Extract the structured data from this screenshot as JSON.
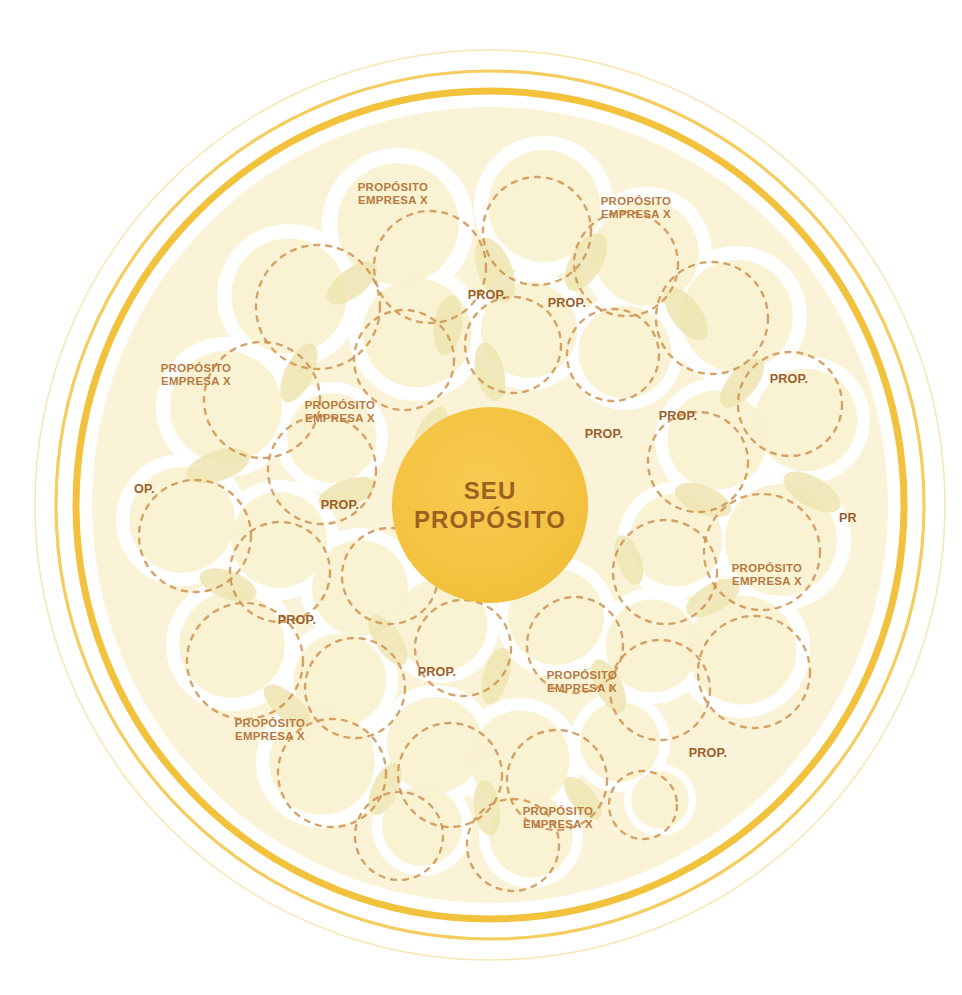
{
  "canvas": {
    "width": 962,
    "height": 995,
    "background": "#ffffff"
  },
  "colors": {
    "core_fill": "#f4c23f",
    "core_text": "#9c6120",
    "ring_thick": "#f2c23c",
    "ring_thin": "#f5cd5e",
    "ring_faint": "#f9e6b4",
    "field_fill": "#faf3d7",
    "bubble_fill": "#f8f1cf",
    "bubble_gap": "#ffffff",
    "overlap_fill": "#efe5b2",
    "dash_stroke": "#cf9350",
    "company_label": "#b8793f",
    "prop_label": "#9a5f2c"
  },
  "core": {
    "name": "seu-proposito-core",
    "line1": "SEU",
    "line2": "PROPÓSITO",
    "cx": 490,
    "cy": 505,
    "r": 98
  },
  "rings": [
    {
      "name": "ring-outer-faint",
      "r": 455,
      "width": 1.6,
      "color": "#f9e6b4"
    },
    {
      "name": "ring-middle-thin",
      "r": 434,
      "width": 3.2,
      "color": "#f5cd5e"
    },
    {
      "name": "ring-inner-thick",
      "r": 414,
      "width": 7.0,
      "color": "#f2c23c"
    },
    {
      "name": "field-boundary",
      "r": 398,
      "width": 0,
      "color": "#faf3d7"
    }
  ],
  "company_labels": [
    {
      "name": "label-company-1",
      "line1": "PROPÓSITO",
      "line2": "EMPRESA X",
      "x": 393,
      "y": 194
    },
    {
      "name": "label-company-2",
      "line1": "PROPÓSITO",
      "line2": "EMPRESA X",
      "x": 636,
      "y": 208
    },
    {
      "name": "label-company-3",
      "line1": "PROPÓSITO",
      "line2": "EMPRESA X",
      "x": 196,
      "y": 375
    },
    {
      "name": "label-company-4",
      "line1": "PROPÓSITO",
      "line2": "EMPRESA X",
      "x": 340,
      "y": 412
    },
    {
      "name": "label-company-5",
      "line1": "PROPÓSITO",
      "line2": "EMPRESA X",
      "x": 767,
      "y": 575
    },
    {
      "name": "label-company-6",
      "line1": "PROPÓSITO",
      "line2": "EMPRESA X",
      "x": 582,
      "y": 682
    },
    {
      "name": "label-company-7",
      "line1": "PROPÓSITO",
      "line2": "EMPRESA X",
      "x": 270,
      "y": 730
    },
    {
      "name": "label-company-8",
      "line1": "PROPÓSITO",
      "line2": "EMPRESA X",
      "x": 558,
      "y": 818
    }
  ],
  "prop_labels": [
    {
      "name": "label-prop-1",
      "text": "PROP.",
      "x": 487,
      "y": 295
    },
    {
      "name": "label-prop-2",
      "text": "PROP.",
      "x": 567,
      "y": 303
    },
    {
      "name": "label-prop-3",
      "text": "PROP.",
      "x": 789,
      "y": 379
    },
    {
      "name": "label-prop-4",
      "text": "PROP.",
      "x": 678,
      "y": 416
    },
    {
      "name": "label-prop-5",
      "text": "PROP.",
      "x": 604,
      "y": 434
    },
    {
      "name": "label-prop-6",
      "text": "PROP.",
      "x": 340,
      "y": 505
    },
    {
      "name": "label-prop-7",
      "text": "PROP.",
      "x": 297,
      "y": 620
    },
    {
      "name": "label-prop-8",
      "text": "PROP.",
      "x": 437,
      "y": 672
    },
    {
      "name": "label-prop-9",
      "text": "PROP.",
      "x": 708,
      "y": 753
    }
  ],
  "clipped_labels": [
    {
      "name": "label-clipped-left",
      "text": "OP.",
      "x": 134,
      "y": 489,
      "align": "left",
      "clip_width": 26
    },
    {
      "name": "label-clipped-right",
      "text": "PR",
      "x": 839,
      "y": 518,
      "align": "left",
      "clip_width": 20
    }
  ],
  "bubbles": [
    {
      "cx": 398,
      "cy": 224,
      "r": 76
    },
    {
      "cx": 544,
      "cy": 206,
      "r": 70
    },
    {
      "cx": 646,
      "cy": 253,
      "r": 66
    },
    {
      "cx": 289,
      "cy": 296,
      "r": 72
    },
    {
      "cx": 417,
      "cy": 333,
      "r": 68
    },
    {
      "cx": 529,
      "cy": 330,
      "r": 60
    },
    {
      "cx": 625,
      "cy": 352,
      "r": 58
    },
    {
      "cx": 737,
      "cy": 316,
      "r": 70
    },
    {
      "cx": 226,
      "cy": 407,
      "r": 70
    },
    {
      "cx": 332,
      "cy": 438,
      "r": 56
    },
    {
      "cx": 717,
      "cy": 440,
      "r": 62
    },
    {
      "cx": 806,
      "cy": 420,
      "r": 64
    },
    {
      "cx": 182,
      "cy": 520,
      "r": 66
    },
    {
      "cx": 279,
      "cy": 540,
      "r": 60
    },
    {
      "cx": 360,
      "cy": 588,
      "r": 60
    },
    {
      "cx": 676,
      "cy": 540,
      "r": 58
    },
    {
      "cx": 781,
      "cy": 540,
      "r": 70
    },
    {
      "cx": 232,
      "cy": 645,
      "r": 66
    },
    {
      "cx": 340,
      "cy": 680,
      "r": 58
    },
    {
      "cx": 441,
      "cy": 625,
      "r": 58
    },
    {
      "cx": 556,
      "cy": 617,
      "r": 60
    },
    {
      "cx": 652,
      "cy": 646,
      "r": 58
    },
    {
      "cx": 742,
      "cy": 650,
      "r": 68
    },
    {
      "cx": 322,
      "cy": 762,
      "r": 66
    },
    {
      "cx": 435,
      "cy": 745,
      "r": 60
    },
    {
      "cx": 520,
      "cy": 760,
      "r": 62
    },
    {
      "cx": 620,
      "cy": 742,
      "r": 50
    },
    {
      "cx": 660,
      "cy": 800,
      "r": 36
    },
    {
      "cx": 422,
      "cy": 826,
      "r": 50
    },
    {
      "cx": 531,
      "cy": 836,
      "r": 52
    }
  ],
  "dashed_circles": [
    {
      "cx": 318,
      "cy": 307,
      "r": 62
    },
    {
      "cx": 430,
      "cy": 267,
      "r": 56
    },
    {
      "cx": 537,
      "cy": 231,
      "r": 54
    },
    {
      "cx": 626,
      "cy": 264,
      "r": 52
    },
    {
      "cx": 262,
      "cy": 400,
      "r": 58
    },
    {
      "cx": 404,
      "cy": 360,
      "r": 50
    },
    {
      "cx": 513,
      "cy": 345,
      "r": 48
    },
    {
      "cx": 613,
      "cy": 355,
      "r": 46
    },
    {
      "cx": 712,
      "cy": 318,
      "r": 56
    },
    {
      "cx": 790,
      "cy": 404,
      "r": 52
    },
    {
      "cx": 322,
      "cy": 470,
      "r": 54
    },
    {
      "cx": 698,
      "cy": 462,
      "r": 50
    },
    {
      "cx": 195,
      "cy": 536,
      "r": 56
    },
    {
      "cx": 280,
      "cy": 572,
      "r": 50
    },
    {
      "cx": 390,
      "cy": 576,
      "r": 48
    },
    {
      "cx": 665,
      "cy": 572,
      "r": 52
    },
    {
      "cx": 762,
      "cy": 552,
      "r": 58
    },
    {
      "cx": 245,
      "cy": 661,
      "r": 58
    },
    {
      "cx": 355,
      "cy": 688,
      "r": 50
    },
    {
      "cx": 463,
      "cy": 648,
      "r": 48
    },
    {
      "cx": 575,
      "cy": 645,
      "r": 48
    },
    {
      "cx": 660,
      "cy": 690,
      "r": 50
    },
    {
      "cx": 754,
      "cy": 672,
      "r": 56
    },
    {
      "cx": 332,
      "cy": 773,
      "r": 54
    },
    {
      "cx": 450,
      "cy": 775,
      "r": 52
    },
    {
      "cx": 557,
      "cy": 780,
      "r": 50
    },
    {
      "cx": 643,
      "cy": 805,
      "r": 34
    },
    {
      "cx": 399,
      "cy": 836,
      "r": 44
    },
    {
      "cx": 513,
      "cy": 845,
      "r": 46
    }
  ],
  "lens_overlaps": [
    {
      "cx": 495,
      "cy": 270,
      "rx": 17,
      "ry": 34,
      "rot": -22
    },
    {
      "cx": 586,
      "cy": 262,
      "rx": 16,
      "ry": 32,
      "rot": 30
    },
    {
      "cx": 352,
      "cy": 283,
      "rx": 14,
      "ry": 30,
      "rot": 52
    },
    {
      "cx": 448,
      "cy": 325,
      "rx": 14,
      "ry": 30,
      "rot": 8
    },
    {
      "cx": 686,
      "cy": 314,
      "rx": 15,
      "ry": 31,
      "rot": -36
    },
    {
      "cx": 299,
      "cy": 373,
      "rx": 14,
      "ry": 32,
      "rot": 26
    },
    {
      "cx": 490,
      "cy": 372,
      "rx": 14,
      "ry": 30,
      "rot": -14
    },
    {
      "cx": 742,
      "cy": 383,
      "rx": 14,
      "ry": 30,
      "rot": 40
    },
    {
      "cx": 218,
      "cy": 466,
      "rx": 15,
      "ry": 33,
      "rot": 72
    },
    {
      "cx": 347,
      "cy": 493,
      "rx": 13,
      "ry": 30,
      "rot": 70
    },
    {
      "cx": 703,
      "cy": 500,
      "rx": 14,
      "ry": 30,
      "rot": -68
    },
    {
      "cx": 812,
      "cy": 492,
      "rx": 15,
      "ry": 32,
      "rot": -60
    },
    {
      "cx": 228,
      "cy": 585,
      "rx": 14,
      "ry": 30,
      "rot": -70
    },
    {
      "cx": 388,
      "cy": 640,
      "rx": 13,
      "ry": 29,
      "rot": -34
    },
    {
      "cx": 713,
      "cy": 598,
      "rx": 14,
      "ry": 30,
      "rot": 60
    },
    {
      "cx": 287,
      "cy": 706,
      "rx": 13,
      "ry": 29,
      "rot": -48
    },
    {
      "cx": 496,
      "cy": 676,
      "rx": 13,
      "ry": 29,
      "rot": 16
    },
    {
      "cx": 609,
      "cy": 686,
      "rx": 13,
      "ry": 29,
      "rot": -26
    },
    {
      "cx": 385,
      "cy": 789,
      "rx": 13,
      "ry": 28,
      "rot": 24
    },
    {
      "cx": 487,
      "cy": 808,
      "rx": 13,
      "ry": 28,
      "rot": -8
    },
    {
      "cx": 583,
      "cy": 798,
      "rx": 12,
      "ry": 26,
      "rot": -40
    },
    {
      "cx": 629,
      "cy": 560,
      "rx": 12,
      "ry": 26,
      "rot": -20
    },
    {
      "cx": 431,
      "cy": 430,
      "rx": 12,
      "ry": 26,
      "rot": 30
    }
  ]
}
